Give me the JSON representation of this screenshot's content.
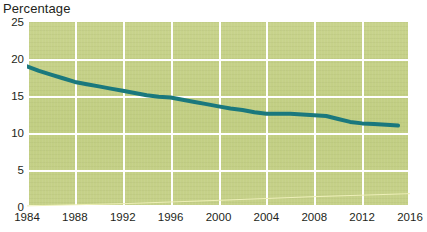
{
  "chart_data": {
    "type": "line",
    "title": "",
    "ylabel": "Percentage",
    "xlabel": "",
    "xlim": [
      1984,
      2016
    ],
    "ylim": [
      0,
      25
    ],
    "grid": true,
    "legend": "none",
    "background_color": "#c4d086",
    "gridline_color": "#ffffff",
    "xticks": [
      1984,
      1988,
      1992,
      1996,
      2000,
      2004,
      2008,
      2012,
      2016
    ],
    "yticks": [
      0,
      5,
      10,
      15,
      20,
      25
    ],
    "series": [
      {
        "name": "Percentage",
        "color": "#1a787d",
        "line_width": 4,
        "x": [
          1984,
          1985,
          1986,
          1987,
          1988,
          1989,
          1990,
          1991,
          1992,
          1993,
          1994,
          1995,
          1996,
          1997,
          1998,
          1999,
          2000,
          2001,
          2002,
          2003,
          2004,
          2005,
          2006,
          2007,
          2008,
          2009,
          2010,
          2011,
          2012,
          2013,
          2014,
          2015
        ],
        "values": [
          19.0,
          18.4,
          17.9,
          17.4,
          16.9,
          16.6,
          16.3,
          16.0,
          15.7,
          15.4,
          15.1,
          14.9,
          14.8,
          14.5,
          14.2,
          13.9,
          13.6,
          13.3,
          13.1,
          12.8,
          12.6,
          12.6,
          12.6,
          12.5,
          12.4,
          12.3,
          11.9,
          11.5,
          11.3,
          11.2,
          11.1,
          11.0
        ]
      },
      {
        "name": "baseline-trace",
        "color": "#eef0b8",
        "line_width": 1,
        "x": [
          1984,
          1992,
          2000,
          2008,
          2016
        ],
        "values": [
          0.15,
          0.45,
          0.9,
          1.4,
          1.8
        ]
      }
    ]
  }
}
